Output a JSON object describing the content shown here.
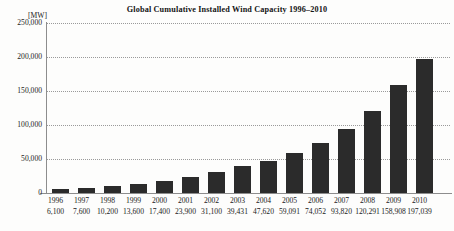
{
  "chart_data": {
    "type": "bar",
    "title": "Global Cumulative Installed Wind Capacity 1996–2010",
    "unit_label": "[MW]",
    "xlabel": "",
    "ylabel": "[MW]",
    "ylim": [
      0,
      250000
    ],
    "grid": true,
    "legend": "none",
    "categories": [
      "1996",
      "1997",
      "1998",
      "1999",
      "2000",
      "2001",
      "2002",
      "2003",
      "2004",
      "2005",
      "2006",
      "2007",
      "2008",
      "2009",
      "2010"
    ],
    "values": [
      6100,
      7600,
      10200,
      13600,
      17400,
      23900,
      31100,
      39431,
      47620,
      59091,
      74052,
      93820,
      120291,
      158908,
      197039
    ],
    "value_labels": [
      "6,100",
      "7,600",
      "10,200",
      "13,600",
      "17,400",
      "23,900",
      "31,100",
      "39,431",
      "47,620",
      "59,091",
      "74,052",
      "93,820",
      "120,291",
      "158,908",
      "197,039"
    ],
    "ytick_labels": [
      "250,000",
      "200,000",
      "150,000",
      "100,000",
      "50,000",
      "0"
    ],
    "ytick_values": [
      250000,
      200000,
      150000,
      100000,
      50000,
      0
    ],
    "bar_color": "#2b2b2b",
    "grid_color": "#9a9a9a",
    "axis_color": "#8d8d8d",
    "background_color": "#fdfdfc",
    "text_color": "#1a1a1a"
  }
}
